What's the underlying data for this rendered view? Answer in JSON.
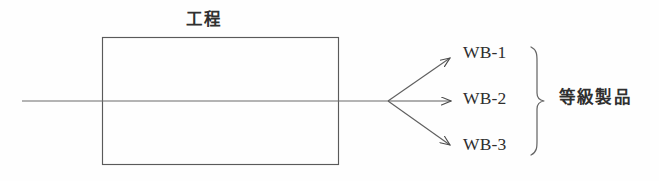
{
  "figure": {
    "title": "工程",
    "background_color": "#fefefe",
    "stroke_color": "#555555",
    "text_color": "#2f2f2f",
    "width": 659,
    "height": 181
  },
  "process_box": {
    "label": "工程",
    "x": 102,
    "y": 37,
    "width": 237,
    "height": 128
  },
  "input_flow": {
    "label": "",
    "from_x": 22,
    "to_x": 388,
    "y": 101
  },
  "branch_point": {
    "x": 388,
    "y": 101
  },
  "outputs": [
    {
      "label": "WB-1",
      "arrow_end_x": 452,
      "arrow_end_y": 57,
      "label_x": 463,
      "label_y": 44
    },
    {
      "label": "WB-2",
      "arrow_end_x": 452,
      "arrow_end_y": 101,
      "label_x": 463,
      "label_y": 90
    },
    {
      "label": "WB-3",
      "arrow_end_x": 452,
      "arrow_end_y": 146,
      "label_x": 463,
      "label_y": 136
    }
  ],
  "group_brace": {
    "label": "等級製品",
    "top_y": 47,
    "bottom_y": 155,
    "tip_x": 545,
    "spine_x": 534
  }
}
